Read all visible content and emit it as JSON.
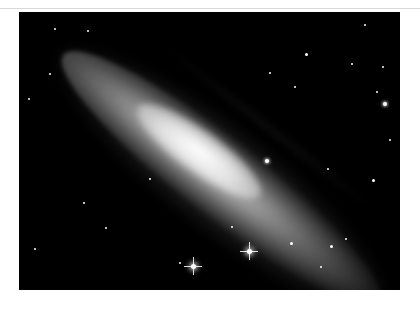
{
  "image": {
    "subject": "edge-on spiral galaxy",
    "description": "Black-and-white astronomical photograph of an elongated spiral galaxy oriented diagonally from upper-left to lower-right against a black star field",
    "colors": {
      "background": "#ffffff",
      "sky": "#000000",
      "galaxy_core": "#f5f5f5"
    },
    "bright_stars": [
      {
        "x": 193,
        "y": 266,
        "spikes": true
      },
      {
        "x": 249,
        "y": 251,
        "spikes": true
      },
      {
        "x": 384,
        "y": 103,
        "spikes": false
      }
    ]
  }
}
